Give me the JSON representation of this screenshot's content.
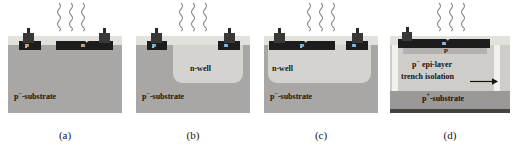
{
  "figure": {
    "colors": {
      "oxide": "#e3e1dc",
      "substrate": "#a8a7a5",
      "nwell": "#d5d3cf",
      "epi": "#cfcdc9",
      "p_plus_substrate": "#9a9997",
      "p_body": "#b4b2ae",
      "diffusion": "#1d1d1d",
      "back_metal": "#46443f",
      "trench": "#f2f1ee",
      "contact_metal": "#2a2825",
      "background": "#ffffff",
      "text": "#17150f"
    },
    "photon_count": 3
  },
  "panels": [
    {
      "id": "a",
      "caption": "(a)",
      "regions": [
        {
          "name": "p-plus-diffusion",
          "base": "p",
          "sup": "+",
          "label": "p+"
        },
        {
          "name": "n-plus-diffusion",
          "base": "n",
          "sup": "+",
          "label": "n+"
        }
      ],
      "substrate": {
        "base": "p",
        "sup": "−",
        "tail": "-substrate",
        "label": "p−-substrate"
      },
      "well": null
    },
    {
      "id": "b",
      "caption": "(b)",
      "regions": [
        {
          "name": "p-plus-diffusion",
          "base": "p",
          "sup": "+",
          "label": "p+"
        },
        {
          "name": "n-plus-diffusion",
          "base": "n",
          "sup": "+",
          "label": "n+"
        }
      ],
      "substrate": {
        "base": "p",
        "sup": "−",
        "tail": "-substrate",
        "label": "p−-substrate"
      },
      "well": {
        "name": "n-well",
        "label": "n-well"
      }
    },
    {
      "id": "c",
      "caption": "(c)",
      "regions": [
        {
          "name": "p-plus-diffusion",
          "base": "p",
          "sup": "+",
          "label": "p+"
        },
        {
          "name": "n-plus-diffusion",
          "base": "n",
          "sup": "+",
          "label": "n+"
        }
      ],
      "substrate": {
        "base": "p",
        "sup": "−",
        "tail": "-substrate",
        "label": "p−-substrate"
      },
      "well": {
        "name": "n-well",
        "label": "n-well"
      }
    },
    {
      "id": "d",
      "caption": "(d)",
      "regions": [
        {
          "name": "n-plus-diffusion",
          "base": "n",
          "sup": "+",
          "label": "n+"
        },
        {
          "name": "p-body",
          "base": "p",
          "sup": "",
          "label": "p"
        }
      ],
      "epi": {
        "base": "p",
        "sup": "−",
        "tail": " epi-layer",
        "label": "p− epi-layer"
      },
      "trench": {
        "name": "trench-isolation",
        "label": "trench isolation"
      },
      "substrate": {
        "base": "p",
        "sup": "+",
        "tail": "-substrate",
        "label": "p+-substrate"
      }
    }
  ]
}
